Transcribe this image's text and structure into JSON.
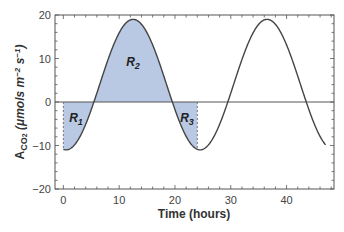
{
  "chart_data": {
    "type": "line",
    "title": "",
    "xlabel": "Time (hours)",
    "ylabel": "A_CO2 (μmols m^-2 s^-1)",
    "ylabel_parts": {
      "main": "A",
      "sub": "CO",
      "sub2": "2",
      "units": " (μmols m",
      "exp1": "−2",
      "mid": " s",
      "exp2": "−1",
      "end": ")"
    },
    "xlim": [
      -1.5,
      48.5
    ],
    "ylim": [
      -20,
      20
    ],
    "x_ticks": [
      0,
      10,
      20,
      30,
      40
    ],
    "x_tick_labels": [
      "0",
      "10",
      "20",
      "30",
      "40"
    ],
    "y_ticks": [
      -20,
      -10,
      0,
      10,
      20
    ],
    "y_tick_labels": [
      "−20",
      "−10",
      "0",
      "10",
      "20"
    ],
    "grid": false,
    "legend": null,
    "series": [
      {
        "name": "A_CO2",
        "description": "Sinusoidal diurnal CO2 assimilation, period 24 h",
        "x": [
          0,
          2,
          4,
          5.5,
          6,
          8,
          10,
          12,
          12.5,
          14,
          16,
          18,
          19.5,
          20,
          22,
          24,
          24.5,
          26,
          28,
          29.5,
          30,
          32,
          34,
          36,
          36.5,
          38,
          40,
          42,
          43.5,
          44,
          46,
          47
        ],
        "values": [
          -10.9,
          -9.5,
          -4.6,
          0,
          1.7,
          8.4,
          14.2,
          18.8,
          19,
          18.5,
          14.2,
          8.4,
          0,
          -1.7,
          -7.3,
          -10.9,
          -11,
          -9.5,
          -4.6,
          0,
          1.7,
          8.4,
          14.2,
          18.8,
          19,
          18.5,
          14.2,
          8.4,
          0,
          -1.7,
          -7.3,
          -10.5
        ]
      }
    ],
    "shaded_regions": [
      {
        "label": "R1",
        "label_main": "R",
        "label_sub": "1",
        "x_range": [
          0,
          5.5
        ],
        "sign": "negative"
      },
      {
        "label": "R2",
        "label_main": "R",
        "label_sub": "2",
        "x_range": [
          5.5,
          19.5
        ],
        "sign": "positive"
      },
      {
        "label": "R3",
        "label_main": "R",
        "label_sub": "3",
        "x_range": [
          19.5,
          24
        ],
        "sign": "negative"
      }
    ],
    "reference_lines": [
      {
        "type": "horizontal",
        "y": 0,
        "style": "solid"
      },
      {
        "type": "vertical",
        "x": 0,
        "style": "dashed"
      },
      {
        "type": "vertical",
        "x": 24,
        "style": "dashed"
      }
    ],
    "colors": {
      "fill": "#b9c9e4",
      "line": "#444444",
      "axis": "#555555"
    }
  }
}
